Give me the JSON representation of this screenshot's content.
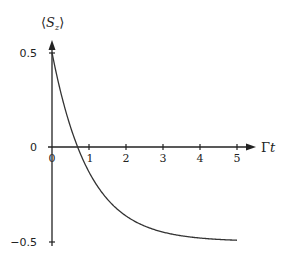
{
  "chart_data": {
    "type": "line",
    "title": "",
    "xlabel": "Γt",
    "ylabel": "⟨S_z⟩",
    "ylabel_parts": {
      "open": "⟨",
      "main": "S",
      "sub": "z",
      "close": "⟩"
    },
    "xlabel_parts": {
      "gamma": "Γ",
      "var": "t"
    },
    "xlim": [
      0,
      5
    ],
    "ylim": [
      -0.5,
      0.5
    ],
    "x_ticks": [
      "0",
      "1",
      "2",
      "3",
      "4",
      "5"
    ],
    "y_ticks": [
      "0.5",
      "0",
      "−0.5"
    ],
    "grid": false,
    "legend": null,
    "series": [
      {
        "name": "⟨S_z⟩(t) = e^(−Γt) − 1/2",
        "x": [
          0,
          0.25,
          0.5,
          0.693,
          1,
          1.5,
          2,
          2.5,
          3,
          3.5,
          4,
          4.5,
          5
        ],
        "values": [
          0.5,
          0.279,
          0.107,
          0.0,
          -0.132,
          -0.277,
          -0.365,
          -0.418,
          -0.45,
          -0.47,
          -0.482,
          -0.489,
          -0.493
        ]
      }
    ]
  },
  "labels": {
    "y_axis": {
      "open": "⟨",
      "main": "S",
      "sub": "z",
      "close": "⟩"
    },
    "x_axis": {
      "gamma": "Γ",
      "var": "t"
    },
    "x_ticks": [
      "0",
      "1",
      "2",
      "3",
      "4",
      "5"
    ],
    "y_ticks": {
      "top": "0.5",
      "mid": "0",
      "bottom": "−0.5"
    }
  }
}
